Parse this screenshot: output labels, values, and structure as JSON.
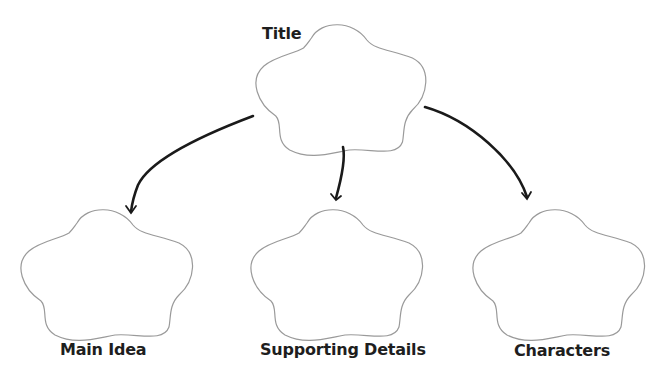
{
  "diagram": {
    "type": "story-map",
    "root": {
      "label": "Title"
    },
    "children": [
      {
        "label": "Main Idea"
      },
      {
        "label": "Supporting Details"
      },
      {
        "label": "Characters"
      }
    ],
    "colors": {
      "outline": "#9a9a9a",
      "arrow": "#1a1a1a",
      "text": "#1e1e1e",
      "background": "#ffffff"
    }
  }
}
